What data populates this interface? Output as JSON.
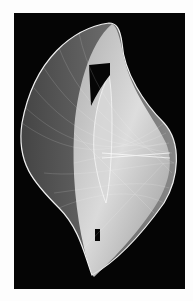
{
  "image": {
    "subject": "white string-art / wireframe curved sculpture on black background",
    "background_color": "#050505",
    "border_color": "#fdfdfd",
    "figure_color": "#e8e8e8"
  }
}
